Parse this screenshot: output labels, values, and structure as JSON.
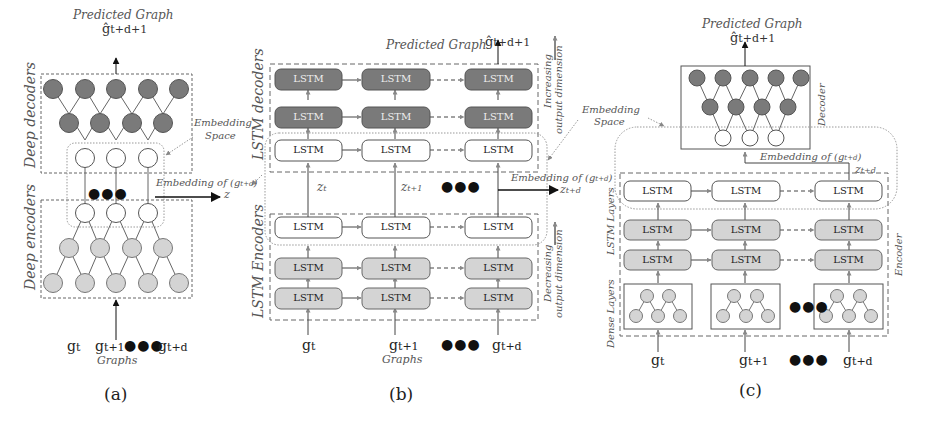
{
  "panels": {
    "a": {
      "caption": "(a)",
      "predicted_title": "Predicted Graph",
      "predicted_symbol": "ĝ",
      "predicted_sub": "t+d+1",
      "decoder_label": "Deep decoders",
      "encoder_label": "Deep encoders",
      "embedding_space_label_line1": "Embedding",
      "embedding_space_label_line2": "Space",
      "embedding_of": "Embedding of (g",
      "embedding_of_sub": "t+d",
      "embedding_of_close": ")",
      "z_label": "z",
      "graphs_label": "Graphs",
      "inputs": [
        {
          "sym": "g",
          "sub": "t"
        },
        {
          "sym": "g",
          "sub": "t+1"
        },
        {
          "sym": "g",
          "sub": "t+d"
        }
      ],
      "ellipsis": "●●●"
    },
    "b": {
      "caption": "(b)",
      "predicted_title": "Predicted Graph",
      "predicted_symbol": "ĝ",
      "predicted_sub": "t+d+1",
      "decoder_label": "LSTM decoders",
      "encoder_label": "LSTM Encoders",
      "increasing_line1": "Increasing",
      "increasing_line2": "output dimension",
      "decreasing_line1": "Decreasing",
      "decreasing_line2": "output dimension",
      "cell_label": "LSTM",
      "z_labels": [
        {
          "sym": "z",
          "sub": "t"
        },
        {
          "sym": "z",
          "sub": "t+1"
        }
      ],
      "embedding_of": "Embedding of (g",
      "embedding_of_sub": "t+d",
      "embedding_of_close": ")",
      "z_out": {
        "sym": "z",
        "sub": "t+d"
      },
      "graphs_label": "Graphs",
      "inputs": [
        {
          "sym": "g",
          "sub": "t"
        },
        {
          "sym": "g",
          "sub": "t+1"
        },
        {
          "sym": "g",
          "sub": "t+d"
        }
      ],
      "ellipsis": "●●●"
    },
    "c": {
      "caption": "(c)",
      "predicted_title": "Predicted Graph",
      "predicted_symbol": "ĝ",
      "predicted_sub": "t+d+1",
      "decoder_label": "Decoder",
      "encoder_label": "Encoder",
      "lstm_layers_label": "LSTM Layers",
      "dense_layers_label": "Dense Layers",
      "embedding_space_label_line1": "Embedding",
      "embedding_space_label_line2": "Space",
      "embedding_of": "Embedding of (g",
      "embedding_of_sub": "t+d",
      "embedding_of_close": ")",
      "z_out": {
        "sym": "z",
        "sub": "t+d"
      },
      "cell_label": "LSTM",
      "inputs": [
        {
          "sym": "g",
          "sub": "t"
        },
        {
          "sym": "g",
          "sub": "t+1"
        },
        {
          "sym": "g",
          "sub": "t+d"
        }
      ],
      "ellipsis": "●●●"
    }
  },
  "colors": {
    "decoder_fill": "#7a7a7a",
    "encoder_fill": "#d4d4d4",
    "embedding_fill": "#ffffff",
    "stroke": "#555555",
    "dashed": "#666666"
  }
}
